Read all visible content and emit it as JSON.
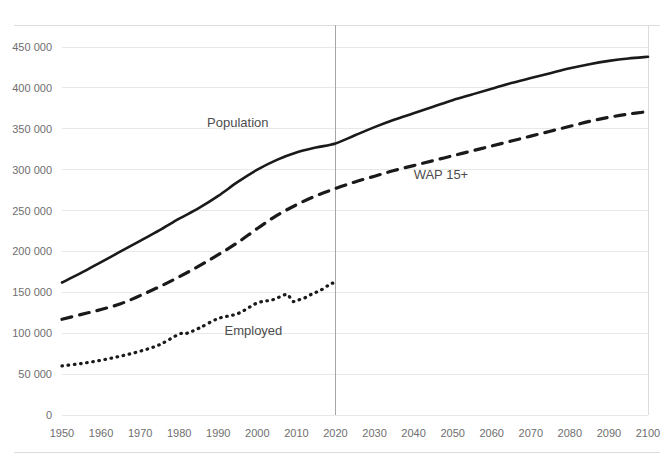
{
  "chart_data": {
    "type": "line",
    "title": "",
    "subtitle": "",
    "xlabel": "",
    "ylabel": "",
    "xlim": [
      1950,
      2100
    ],
    "ylim": [
      0,
      450000
    ],
    "grid": true,
    "legend_position": "inline-annotations",
    "y_ticks": [
      0,
      50000,
      100000,
      150000,
      200000,
      250000,
      300000,
      350000,
      400000,
      450000
    ],
    "y_tick_labels": [
      "0",
      "50 000",
      "100 000",
      "150 000",
      "200 000",
      "250 000",
      "300 000",
      "350 000",
      "400 000",
      "450 000"
    ],
    "x_ticks": [
      1950,
      1960,
      1970,
      1980,
      1990,
      2000,
      2010,
      2020,
      2030,
      2040,
      2050,
      2060,
      2070,
      2080,
      2090,
      2100
    ],
    "x_tick_labels": [
      "1950",
      "1960",
      "1970",
      "1980",
      "1990",
      "2000",
      "2010",
      "2020",
      "2030",
      "2040",
      "2050",
      "2060",
      "2070",
      "2080",
      "2090",
      "2100"
    ],
    "annotations": [
      {
        "text": "Population",
        "x": 1995,
        "y": 352000,
        "series": "Population"
      },
      {
        "text": "WAP 15+",
        "x": 2047,
        "y": 288000,
        "series": "WAP 15+"
      },
      {
        "text": "Employed",
        "x": 1999,
        "y": 98000,
        "series": "Employed"
      }
    ],
    "reference_lines": [
      {
        "orientation": "vertical",
        "x": 2020,
        "label": "",
        "color": "#a6a6a6"
      }
    ],
    "series": [
      {
        "name": "Population",
        "style": "solid",
        "color": "#1a1a1a",
        "x": [
          1950,
          1955,
          1960,
          1965,
          1970,
          1975,
          1980,
          1985,
          1990,
          1995,
          2000,
          2005,
          2010,
          2015,
          2020,
          2025,
          2030,
          2035,
          2040,
          2045,
          2050,
          2055,
          2060,
          2065,
          2070,
          2075,
          2080,
          2085,
          2090,
          2095,
          2100
        ],
        "values": [
          162000,
          174000,
          187000,
          200000,
          213000,
          226000,
          240000,
          253000,
          268000,
          285000,
          300000,
          312000,
          321000,
          327000,
          332000,
          342000,
          352000,
          361000,
          369000,
          377000,
          385000,
          392000,
          399000,
          406000,
          412000,
          418000,
          424000,
          429000,
          433000,
          436000,
          438000
        ]
      },
      {
        "name": "WAP 15+",
        "style": "dashed",
        "color": "#1a1a1a",
        "x": [
          1950,
          1955,
          1960,
          1965,
          1970,
          1975,
          1980,
          1985,
          1990,
          1995,
          2000,
          2005,
          2010,
          2015,
          2020,
          2025,
          2030,
          2035,
          2040,
          2045,
          2050,
          2055,
          2060,
          2065,
          2070,
          2075,
          2080,
          2085,
          2090,
          2095,
          2100
        ],
        "values": [
          117000,
          123000,
          129000,
          136000,
          146000,
          157000,
          169000,
          182000,
          196000,
          211000,
          228000,
          244000,
          257000,
          268000,
          277000,
          285000,
          292000,
          299000,
          305000,
          311000,
          317000,
          323000,
          329000,
          335000,
          341000,
          347000,
          353000,
          359000,
          364000,
          368000,
          371000
        ]
      },
      {
        "name": "Employed",
        "style": "dotted",
        "color": "#1a1a1a",
        "x": [
          1950,
          1955,
          1960,
          1965,
          1970,
          1975,
          1980,
          1982,
          1985,
          1990,
          1995,
          2000,
          2004,
          2007,
          2008,
          2009,
          2010,
          2012,
          2014,
          2016,
          2018,
          2019,
          2020
        ],
        "values": [
          60000,
          63000,
          67000,
          72000,
          78000,
          86000,
          99000,
          100000,
          106000,
          118000,
          124000,
          137000,
          141000,
          147000,
          146000,
          139000,
          140000,
          143000,
          148000,
          152000,
          158000,
          161000,
          161000
        ]
      }
    ]
  },
  "axes": {
    "x_axis_name": "year-axis",
    "y_axis_name": "population-axis"
  }
}
